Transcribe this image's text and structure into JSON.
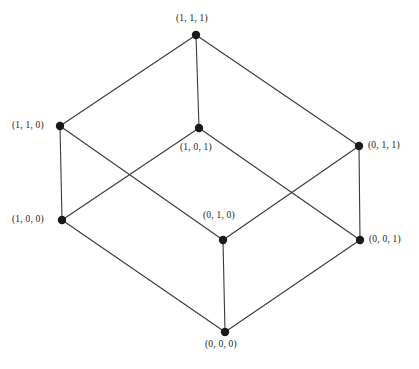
{
  "figure": {
    "name": "binary-cube-graph",
    "background_color": "#ffffff",
    "edge_color": "#3a3a3a",
    "vertex_color": "#1a1a1a",
    "label_color": "#222222",
    "width": 419,
    "height": 369
  },
  "chart_data": {
    "type": "diagram",
    "title": "",
    "vertices": [
      {
        "id": "111",
        "label": "(1, 1, 1)",
        "x": 196,
        "y": 35,
        "label_x": 176,
        "label_y": 14,
        "label_anchor": "above"
      },
      {
        "id": "110",
        "label": "(1, 1, 0)",
        "x": 60,
        "y": 126,
        "label_x": 12,
        "label_y": 121,
        "label_anchor": "left"
      },
      {
        "id": "101",
        "label": "(1, 0, 1)",
        "x": 199,
        "y": 128,
        "label_x": 180,
        "label_y": 143,
        "label_anchor": "below"
      },
      {
        "id": "011",
        "label": "(0, 1, 1)",
        "x": 359,
        "y": 146,
        "label_x": 368,
        "label_y": 141,
        "label_anchor": "right"
      },
      {
        "id": "100",
        "label": "(1, 0, 0)",
        "x": 62,
        "y": 220,
        "label_x": 12,
        "label_y": 215,
        "label_anchor": "left"
      },
      {
        "id": "010",
        "label": "(0, 1, 0)",
        "x": 223,
        "y": 240,
        "label_x": 203,
        "label_y": 211,
        "label_anchor": "above"
      },
      {
        "id": "001",
        "label": "(0, 0, 1)",
        "x": 360,
        "y": 240,
        "label_x": 369,
        "label_y": 235,
        "label_anchor": "right"
      },
      {
        "id": "000",
        "label": "(0, 0, 0)",
        "x": 225,
        "y": 332,
        "label_x": 205,
        "label_y": 340,
        "label_anchor": "below"
      }
    ],
    "edges": [
      {
        "from": "111",
        "to": "110"
      },
      {
        "from": "111",
        "to": "101"
      },
      {
        "from": "111",
        "to": "011"
      },
      {
        "from": "110",
        "to": "100"
      },
      {
        "from": "110",
        "to": "010"
      },
      {
        "from": "101",
        "to": "100"
      },
      {
        "from": "101",
        "to": "001"
      },
      {
        "from": "011",
        "to": "010"
      },
      {
        "from": "011",
        "to": "001"
      },
      {
        "from": "100",
        "to": "000"
      },
      {
        "from": "010",
        "to": "000"
      },
      {
        "from": "001",
        "to": "000"
      }
    ],
    "vertex_radius": 4.2,
    "edge_width": 1.1
  }
}
